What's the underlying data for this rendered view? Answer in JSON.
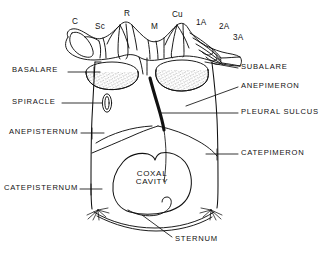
{
  "figure": {
    "ink_color": "#111111",
    "background_color": "#ffffff",
    "stipple_color": "#555555"
  },
  "vein_labels": [
    {
      "id": "costa",
      "text": "C",
      "x": 72,
      "y": 18
    },
    {
      "id": "subcosta",
      "text": "Sc",
      "x": 95,
      "y": 23
    },
    {
      "id": "radius",
      "text": "R",
      "x": 124,
      "y": 10
    },
    {
      "id": "media",
      "text": "M",
      "x": 151,
      "y": 23
    },
    {
      "id": "cubitus",
      "text": "Cu",
      "x": 172,
      "y": 11
    },
    {
      "id": "anal-1",
      "text": "1A",
      "x": 196,
      "y": 19
    },
    {
      "id": "anal-2",
      "text": "2A",
      "x": 219,
      "y": 23
    },
    {
      "id": "anal-3",
      "text": "3A",
      "x": 233,
      "y": 34
    }
  ],
  "left_callouts": [
    {
      "id": "basalare",
      "text": "BASALARE",
      "x": 12,
      "y": 70
    },
    {
      "id": "spiracle",
      "text": "SPIRACLE",
      "x": 12,
      "y": 101
    },
    {
      "id": "anepisternum",
      "text": "ANEPISTERNUM",
      "x": 12,
      "y": 130
    },
    {
      "id": "catepisternum",
      "text": "CATEPISTERNUM",
      "x": 4,
      "y": 186
    }
  ],
  "right_callouts": [
    {
      "id": "subalare",
      "text": "SUBALARE",
      "x": 241,
      "y": 65
    },
    {
      "id": "anepimeron",
      "text": "ANEPIMERON",
      "x": 241,
      "y": 84
    },
    {
      "id": "pleural-sulcus",
      "text": "PLEURAL SULCUS",
      "x": 241,
      "y": 110
    },
    {
      "id": "catepimeron",
      "text": "CATEPIMERON",
      "x": 241,
      "y": 151
    }
  ],
  "bottom_callouts": [
    {
      "id": "sternum",
      "text": "STERNUM",
      "x": 175,
      "y": 239
    }
  ],
  "interior_labels": [
    {
      "id": "coxal-cavity",
      "line1": "COXAL",
      "line2": "CAVITY",
      "x": 145,
      "y": 173
    }
  ]
}
